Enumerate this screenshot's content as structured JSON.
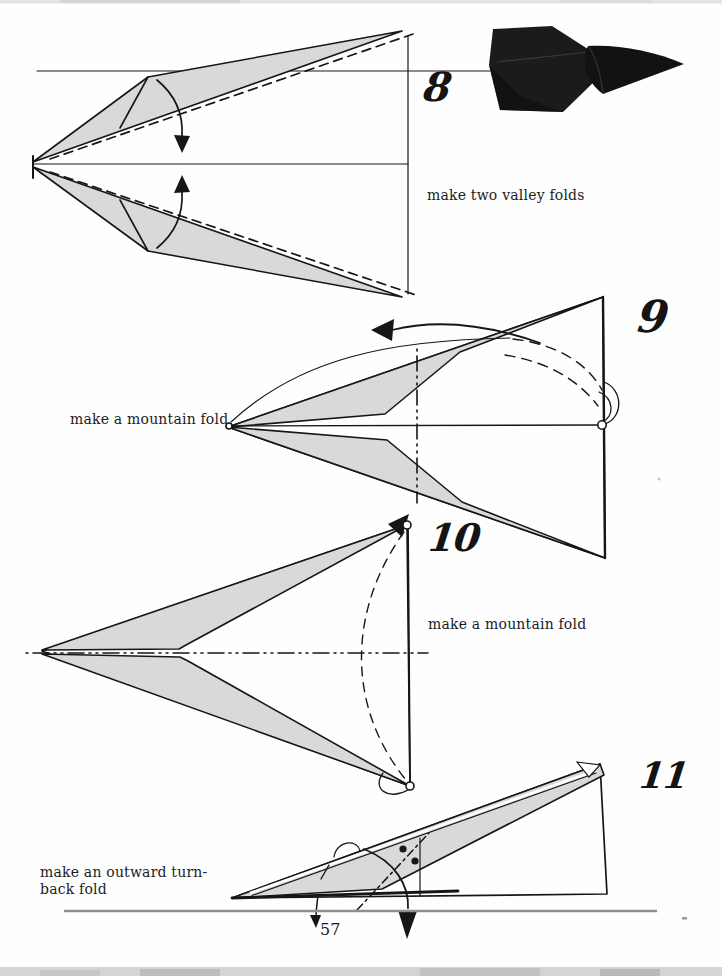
{
  "page_number": "57",
  "steps": [
    {
      "number": "8",
      "caption": "make two valley folds"
    },
    {
      "number": "9",
      "caption": "make a mountain fold"
    },
    {
      "number": "10",
      "caption": "make a mountain fold"
    },
    {
      "number": "11",
      "caption_line1": "make an outward turn-",
      "caption_line2": "back fold"
    }
  ],
  "colors": {
    "paper": "#fefefe",
    "ink": "#161616",
    "diagram_fill": "#d9d9d9",
    "page_rule": "#8f8f8f",
    "photo_ink": "#1b1b1b"
  }
}
